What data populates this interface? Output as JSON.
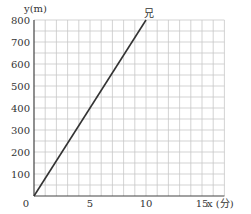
{
  "chart_data": {
    "type": "line",
    "title": "",
    "xlabel": "x (分)",
    "ylabel": "y(m)",
    "xlim": [
      0,
      17
    ],
    "ylim": [
      0,
      800
    ],
    "x_ticks": [
      0,
      5,
      10,
      15
    ],
    "y_ticks": [
      100,
      200,
      300,
      400,
      500,
      600,
      700,
      800
    ],
    "grid": true,
    "grid_x_step": 1,
    "grid_y_step": 50,
    "series": [
      {
        "name": "兄",
        "x": [
          0,
          10
        ],
        "y": [
          0,
          800
        ],
        "color": "#333333"
      }
    ],
    "annotations": [
      {
        "text": "兄",
        "x": 10,
        "y": 800
      }
    ]
  },
  "labels": {
    "origin": "0",
    "y_axis_label": "y(m)",
    "x_axis_label": "x (分)",
    "series_label": "兄"
  },
  "colors": {
    "grid": "#c8c8c8",
    "axis": "#444444",
    "line": "#333333",
    "text": "#333333"
  }
}
